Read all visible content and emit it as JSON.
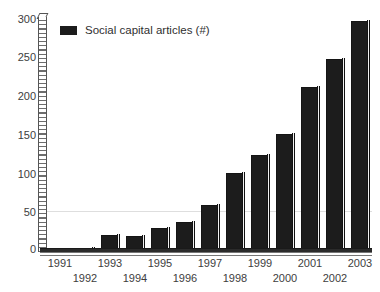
{
  "chart_data": {
    "type": "bar",
    "title": "",
    "xlabel": "",
    "ylabel": "",
    "categories": [
      "1991",
      "1992",
      "1993",
      "1994",
      "1995",
      "1996",
      "1997",
      "1998",
      "1999",
      "2000",
      "2001",
      "2002",
      "2003"
    ],
    "values": [
      3,
      5,
      22,
      20,
      31,
      38,
      60,
      101,
      125,
      151,
      212,
      248,
      296
    ],
    "ylim": [
      0,
      300
    ],
    "yticks": [
      0,
      50,
      100,
      150,
      200,
      250,
      300
    ],
    "grid": false,
    "legend": {
      "position": "top-left",
      "entries": [
        {
          "label": "Social capital articles (#)",
          "color": "#1c1c1c",
          "swatch": "legend-swatch-icon"
        }
      ]
    },
    "style": {
      "bar_color": "#1c1c1c",
      "bar_highlight": "#f2f2f2",
      "axis_color": "#555555",
      "text_color": "#3d3d3d",
      "background": "#ffffff",
      "three_d": true
    }
  }
}
